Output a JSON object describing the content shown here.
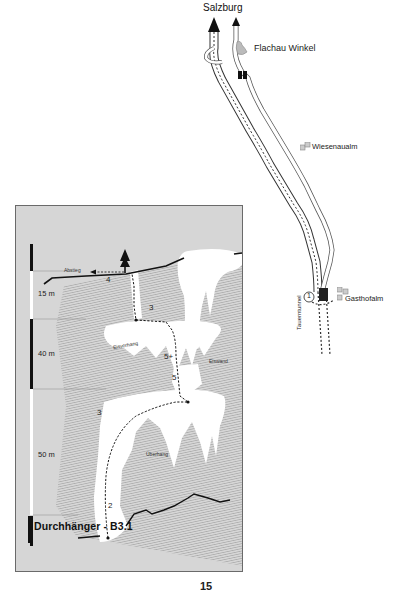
{
  "approach_map": {
    "direction_label": "Salzburg",
    "places": [
      {
        "name": "Flachau Winkel",
        "icon": "village-icon"
      },
      {
        "name": "Wiesenaualm",
        "icon": "building-icon"
      },
      {
        "name": "Gasthofalm",
        "icon": "building-icon"
      }
    ],
    "tunnel_label": "Tauerntunnel",
    "parking_marker": "1"
  },
  "topo": {
    "route_name": "Durchhänger - B3.1",
    "scale_bar": [
      {
        "label": "15 m"
      },
      {
        "label": "40 m"
      },
      {
        "label": "50 m"
      }
    ],
    "descent_label": "Abstieg",
    "pitch_grades": [
      "4",
      "3",
      "5+",
      "5",
      "3",
      "2"
    ],
    "features": [
      "Eiswulst",
      "Eisvorhang",
      "Eiswand",
      "Überhang"
    ],
    "colors": {
      "background": "#d6d6d6",
      "ice": "#ffffff",
      "rock_hatching": "#8a8a8a",
      "route_line": "#111111"
    }
  },
  "page": {
    "number": "15"
  }
}
